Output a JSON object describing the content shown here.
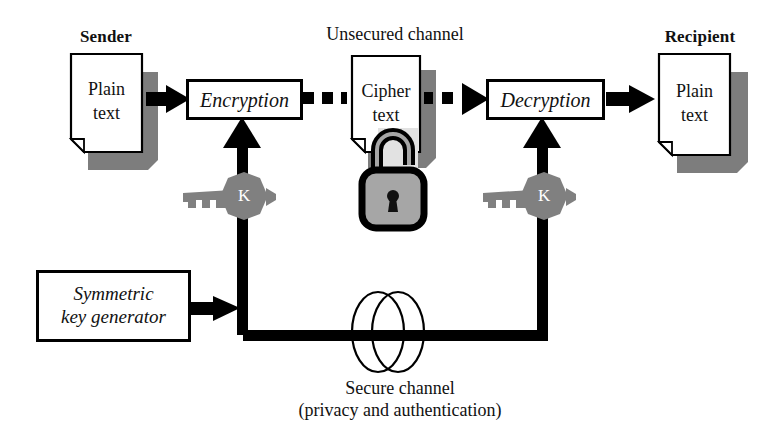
{
  "diagram": {
    "labels": {
      "sender": "Sender",
      "recipient": "Recipient",
      "unsecured_channel": "Unsecured channel",
      "secure_channel_line1": "Secure channel",
      "secure_channel_line2": "(privacy and authentication)"
    },
    "documents": [
      {
        "id": "sender-plaintext",
        "line1": "Plain",
        "line2": "text"
      },
      {
        "id": "cipher-document",
        "line1": "Cipher",
        "line2": "text"
      },
      {
        "id": "recipient-plaintext",
        "line1": "Plain",
        "line2": "text"
      }
    ],
    "process_boxes": [
      {
        "id": "encryption-box",
        "label": "Encryption"
      },
      {
        "id": "decryption-box",
        "label": "Decryption"
      }
    ],
    "key_generator": {
      "line1": "Symmetric",
      "line2": "key generator"
    },
    "keys": [
      {
        "id": "encryption-key",
        "label": "K"
      },
      {
        "id": "decryption-key",
        "label": "K"
      }
    ],
    "icons": {
      "padlock": "padlock-icon",
      "key": "key-icon",
      "secure_channel_coil": "coil-icon"
    },
    "colors": {
      "stroke": "#000000",
      "paper": "#ffffff",
      "shadow": "#7d7d7d",
      "key_fill": "#808080",
      "lock_fill": "#a6a6a6",
      "text": "#111111"
    }
  }
}
